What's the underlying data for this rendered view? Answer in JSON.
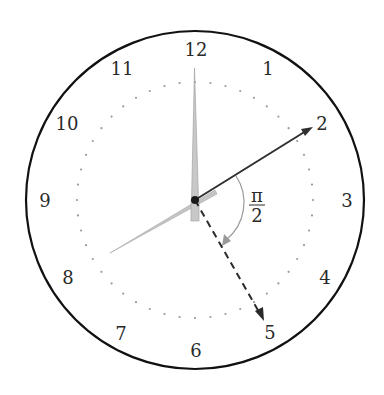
{
  "diagram": {
    "type": "clock-face",
    "center": [
      195,
      200
    ],
    "outer_radius": 169,
    "dotted_radius": 118,
    "colors": {
      "outline": "#111111",
      "solid_arrow": "#333333",
      "dashed_arrow": "#2a2a2a",
      "hand_gray": "#b5b5b5",
      "hand_light": "#bdbdbd",
      "angle_arc": "#9a9a9a",
      "dots": "#9a9a9a",
      "text": "#2a2a2a"
    },
    "numbers": [
      {
        "label": "12",
        "x": 196,
        "y": 56
      },
      {
        "label": "1",
        "x": 268,
        "y": 75
      },
      {
        "label": "2",
        "x": 322,
        "y": 130
      },
      {
        "label": "3",
        "x": 347,
        "y": 207
      },
      {
        "label": "4",
        "x": 325,
        "y": 284
      },
      {
        "label": "5",
        "x": 270,
        "y": 339
      },
      {
        "label": "6",
        "x": 196,
        "y": 357
      },
      {
        "label": "7",
        "x": 121,
        "y": 340
      },
      {
        "label": "8",
        "x": 68,
        "y": 284
      },
      {
        "label": "9",
        "x": 45,
        "y": 207
      },
      {
        "label": "10",
        "x": 67,
        "y": 130
      },
      {
        "label": "11",
        "x": 122,
        "y": 75
      }
    ],
    "angle_label": {
      "numerator": "π",
      "denominator": "2"
    },
    "vectors": [
      {
        "name": "solid-arrow-to-2",
        "to": [
          312,
          128
        ],
        "style": "solid"
      },
      {
        "name": "dashed-arrow-to-5",
        "to": [
          263,
          320
        ],
        "style": "dashed"
      }
    ]
  }
}
